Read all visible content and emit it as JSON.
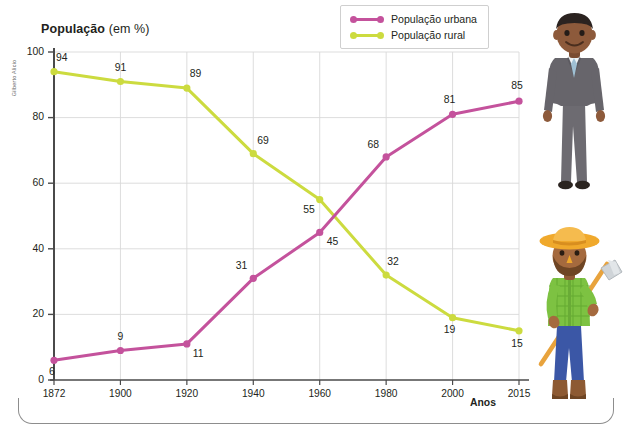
{
  "chart_data": {
    "type": "line",
    "title": "População (em %)",
    "title_strong": "População",
    "title_light": "(em %)",
    "xlabel": "Anos",
    "ylabel": "",
    "categories": [
      "1872",
      "1900",
      "1920",
      "1940",
      "1960",
      "1980",
      "2000",
      "2015"
    ],
    "x": [
      1872,
      1900,
      1920,
      1940,
      1960,
      1980,
      2000,
      2015
    ],
    "series": [
      {
        "name": "População urbana",
        "color": "#c4529c",
        "values": [
          6,
          9,
          11,
          31,
          45,
          68,
          81,
          85
        ]
      },
      {
        "name": "População rural",
        "color": "#ccdb3f",
        "values": [
          94,
          91,
          89,
          69,
          55,
          32,
          19,
          15
        ]
      }
    ],
    "ylim": [
      0,
      100
    ],
    "yticks": [
      0,
      20,
      40,
      60,
      80,
      100
    ],
    "ytick_labels": [
      "0",
      "20",
      "40",
      "60",
      "80",
      "100"
    ],
    "grid": true,
    "grid_axis": "both",
    "legend_position": "top-right"
  },
  "legend": {
    "items": [
      {
        "label": "População urbana",
        "color": "#c4529c"
      },
      {
        "label": "População rural",
        "color": "#ccdb3f"
      }
    ]
  },
  "axis": {
    "x_caption": "Anos"
  },
  "credit": {
    "text": "Gilberto Alicio"
  },
  "illustrations": {
    "urban": {
      "name": "businessman-figure",
      "description": "Homem de terno cinza",
      "suit_color": "#67656b",
      "skin_color": "#8d5a3b",
      "hair_color": "#2b2320",
      "shirt_color": "#e8eef2",
      "tie_color": "#9fc0d4",
      "shoe_color": "#2e2724"
    },
    "rural": {
      "name": "farmer-figure",
      "description": "Agricultor com chapéu de palha e enxada",
      "hat_color": "#f0a92c",
      "shirt_color": "#7dc242",
      "pants_color": "#3b57a6",
      "boot_color": "#8d5a33",
      "skin_color": "#a56a3e",
      "beard_color": "#6e4524",
      "hoe_handle_color": "#e8a33d",
      "hoe_blade_color": "#cfd4d8"
    }
  }
}
